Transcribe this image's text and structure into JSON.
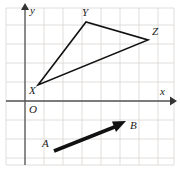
{
  "figure": {
    "background_color": "#ffffff",
    "grid": {
      "color": "#d8d5d2",
      "spacing_px": 19,
      "frame": {
        "x": 6,
        "y": 8,
        "width": 168,
        "height": 157
      },
      "visible": true
    },
    "axes": {
      "color": "#555555",
      "origin_label": "O",
      "origin_label_pos": {
        "x": 29,
        "y": 104
      },
      "x_axis": {
        "label": "x",
        "label_pos": {
          "x": 160,
          "y": 86
        },
        "y_px": 101,
        "from_x": 6,
        "to_x": 174,
        "arrow": "right"
      },
      "y_axis": {
        "label": "y",
        "label_pos": {
          "x": 29,
          "y": 5
        },
        "x_px": 25,
        "from_y": 165,
        "to_y": 6,
        "arrow": "up"
      }
    },
    "shapes": [
      {
        "kind": "triangle",
        "name": "triangle-XYZ",
        "stroke_color": "#111111",
        "stroke_width": 1.6,
        "fill": "none",
        "vertices": [
          {
            "label": "X",
            "x": 38,
            "y": 85,
            "label_x": 29,
            "label_y": 85
          },
          {
            "label": "Y",
            "x": 86,
            "y": 22,
            "label_x": 82,
            "label_y": 7
          },
          {
            "label": "Z",
            "x": 148,
            "y": 40,
            "label_x": 152,
            "label_y": 26
          }
        ]
      },
      {
        "kind": "vector",
        "name": "vector-AB",
        "stroke_color": "#111111",
        "stroke_width": 3.4,
        "start": {
          "label": "A",
          "x": 54,
          "y": 151,
          "label_x": 42,
          "label_y": 138
        },
        "end": {
          "label": "B",
          "x": 124,
          "y": 122,
          "label_x": 130,
          "label_y": 120
        },
        "arrow": "end"
      }
    ],
    "labels": [
      {
        "name": "vertex-label-X",
        "text": "X"
      },
      {
        "name": "vertex-label-Y",
        "text": "Y"
      },
      {
        "name": "vertex-label-Z",
        "text": "Z"
      },
      {
        "name": "point-label-A",
        "text": "A"
      },
      {
        "name": "point-label-B",
        "text": "B"
      },
      {
        "name": "origin-label",
        "text": "O"
      },
      {
        "name": "x-axis-label",
        "text": "x"
      },
      {
        "name": "y-axis-label",
        "text": "y"
      }
    ]
  }
}
